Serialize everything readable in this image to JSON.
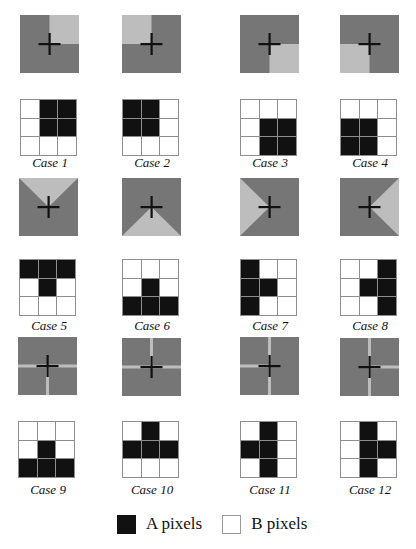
{
  "colors": {
    "a_region": "#767676",
    "b_region": "#bdbdbd",
    "a_pixel": "#111111",
    "b_pixel": "#ffffff",
    "cross": "#111111",
    "grid_line": "#8e8e8e"
  },
  "cases": [
    {
      "label": "Case 1",
      "pattern": "quadrant-top-right",
      "a_cells": [
        [
          0,
          1
        ],
        [
          0,
          2
        ],
        [
          1,
          1
        ],
        [
          1,
          2
        ]
      ]
    },
    {
      "label": "Case 2",
      "pattern": "quadrant-top-left",
      "a_cells": [
        [
          0,
          0
        ],
        [
          0,
          1
        ],
        [
          1,
          0
        ],
        [
          1,
          1
        ]
      ]
    },
    {
      "label": "Case 3",
      "pattern": "quadrant-bottom-right",
      "a_cells": [
        [
          1,
          1
        ],
        [
          1,
          2
        ],
        [
          2,
          1
        ],
        [
          2,
          2
        ]
      ]
    },
    {
      "label": "Case 4",
      "pattern": "quadrant-bottom-left",
      "a_cells": [
        [
          1,
          0
        ],
        [
          1,
          1
        ],
        [
          2,
          0
        ],
        [
          2,
          1
        ]
      ]
    },
    {
      "label": "Case 5",
      "pattern": "triangle-top",
      "a_cells": [
        [
          0,
          0
        ],
        [
          0,
          1
        ],
        [
          0,
          2
        ],
        [
          1,
          1
        ]
      ]
    },
    {
      "label": "Case 6",
      "pattern": "triangle-bottom",
      "a_cells": [
        [
          1,
          1
        ],
        [
          2,
          0
        ],
        [
          2,
          1
        ],
        [
          2,
          2
        ]
      ]
    },
    {
      "label": "Case 7",
      "pattern": "triangle-left",
      "a_cells": [
        [
          0,
          0
        ],
        [
          1,
          0
        ],
        [
          1,
          1
        ],
        [
          2,
          0
        ]
      ]
    },
    {
      "label": "Case 8",
      "pattern": "triangle-right",
      "a_cells": [
        [
          0,
          2
        ],
        [
          1,
          1
        ],
        [
          1,
          2
        ],
        [
          2,
          2
        ]
      ]
    },
    {
      "label": "Case 9",
      "pattern": "lines-left-right-bottom",
      "a_cells": [
        [
          1,
          1
        ],
        [
          2,
          0
        ],
        [
          2,
          1
        ],
        [
          2,
          2
        ]
      ]
    },
    {
      "label": "Case 10",
      "pattern": "lines-left-right-top",
      "a_cells": [
        [
          0,
          1
        ],
        [
          1,
          0
        ],
        [
          1,
          1
        ],
        [
          1,
          2
        ]
      ]
    },
    {
      "label": "Case 11",
      "pattern": "lines-top-bottom-left",
      "a_cells": [
        [
          0,
          1
        ],
        [
          1,
          0
        ],
        [
          1,
          1
        ],
        [
          2,
          1
        ]
      ]
    },
    {
      "label": "Case 12",
      "pattern": "lines-top-bottom-right",
      "a_cells": [
        [
          0,
          1
        ],
        [
          1,
          1
        ],
        [
          1,
          2
        ],
        [
          2,
          1
        ]
      ]
    }
  ],
  "legend": {
    "a_label": "A pixels",
    "b_label": "B pixels"
  }
}
